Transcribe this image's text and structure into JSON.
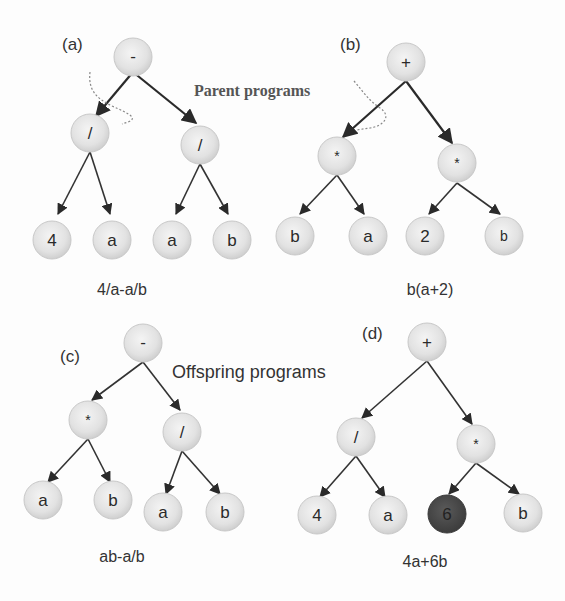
{
  "annotations": {
    "parent_label": "Parent programs",
    "offspring_label": "Offspring programs"
  },
  "colors": {
    "node_fill": "#e4e4e4",
    "node_stroke": "#c4c4c4",
    "highlight_fill": "#4a4a4a",
    "edge": "#333333"
  },
  "trees": [
    {
      "id": "a",
      "tag": "(a)",
      "role": "parent",
      "expression": "4/a-a/b",
      "nodes": [
        {
          "label": "-"
        },
        {
          "label": "/"
        },
        {
          "label": "/"
        },
        {
          "label": "4"
        },
        {
          "label": "a"
        },
        {
          "label": "a"
        },
        {
          "label": "b"
        }
      ]
    },
    {
      "id": "b",
      "tag": "(b)",
      "role": "parent",
      "expression": "b(a+2)",
      "nodes": [
        {
          "label": "+"
        },
        {
          "label": "*"
        },
        {
          "label": "*"
        },
        {
          "label": "b"
        },
        {
          "label": "a"
        },
        {
          "label": "2"
        },
        {
          "label": "b"
        }
      ]
    },
    {
      "id": "c",
      "tag": "(c)",
      "role": "offspring",
      "expression": "ab-a/b",
      "nodes": [
        {
          "label": "-"
        },
        {
          "label": "*"
        },
        {
          "label": "/"
        },
        {
          "label": "a"
        },
        {
          "label": "b"
        },
        {
          "label": "a"
        },
        {
          "label": "b"
        }
      ]
    },
    {
      "id": "d",
      "tag": "(d)",
      "role": "offspring",
      "expression": "4a+6b",
      "nodes": [
        {
          "label": "+"
        },
        {
          "label": "/"
        },
        {
          "label": "*"
        },
        {
          "label": "4"
        },
        {
          "label": "a"
        },
        {
          "label": "6",
          "highlighted": true
        },
        {
          "label": "b"
        }
      ]
    }
  ]
}
